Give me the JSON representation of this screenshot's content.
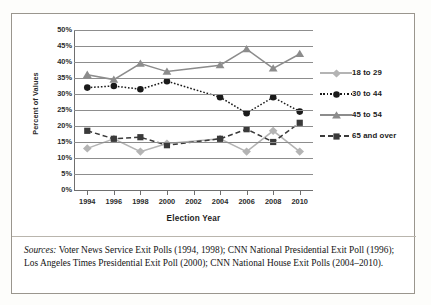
{
  "chart_data": {
    "type": "line",
    "title": "",
    "xlabel": "Election Year",
    "ylabel": "Percent of Values",
    "categories": [
      "1994",
      "1996",
      "1998",
      "2000",
      "2002",
      "2004",
      "2006",
      "2008",
      "2010"
    ],
    "ylim": [
      0,
      50
    ],
    "ytick_labels": [
      "0%",
      "5%",
      "10%",
      "15%",
      "20%",
      "25%",
      "30%",
      "35%",
      "40%",
      "45%",
      "50%"
    ],
    "ytick_values": [
      0,
      5,
      10,
      15,
      20,
      25,
      30,
      35,
      40,
      45,
      50
    ],
    "grid": true,
    "legend_position": "right",
    "series": [
      {
        "name": "18 to 29",
        "color": "#b4b4b4",
        "marker": "diamond",
        "linestyle": "solid",
        "values": [
          13,
          16,
          12,
          14.5,
          null,
          16,
          12,
          18.5,
          12
        ]
      },
      {
        "name": "30 to 44",
        "color": "#1a1a1a",
        "marker": "circle",
        "linestyle": "dotted",
        "values": [
          32,
          32.5,
          31.5,
          34,
          null,
          29,
          24,
          29,
          24.5
        ]
      },
      {
        "name": "45 to 54",
        "color": "#8c8c8c",
        "marker": "triangle",
        "linestyle": "solid",
        "values": [
          36,
          34.5,
          39.5,
          37,
          null,
          39,
          44,
          38,
          42.5
        ]
      },
      {
        "name": "65 and over",
        "color": "#3a3a3a",
        "marker": "square",
        "linestyle": "dashed",
        "values": [
          18.5,
          16,
          16.5,
          14,
          null,
          16,
          19,
          15,
          21
        ]
      }
    ]
  },
  "sources": {
    "label": "Sources:",
    "text": " Voter News Service Exit Polls (1994, 1998); CNN National Presidential Exit Poll (1996); Los Angeles Times Presidential Exit Poll (2000); CNN National House Exit Polls (2004–2010)."
  }
}
